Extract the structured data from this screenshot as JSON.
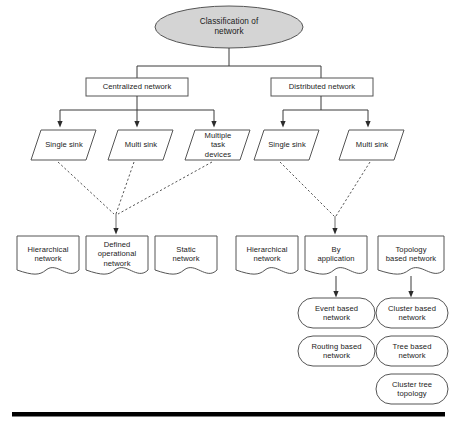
{
  "diagram": {
    "title_node": {
      "id": "root",
      "label": "Classification of\nnetwork",
      "shape": "ellipse",
      "fill": "#d4d4d4"
    },
    "level1": [
      {
        "id": "centralized",
        "label": "Centralized network",
        "shape": "rect"
      },
      {
        "id": "distributed",
        "label": "Distributed network",
        "shape": "rect"
      }
    ],
    "level2": [
      {
        "id": "c-single-sink",
        "label": "Single sink",
        "shape": "parallelogram",
        "parent": "centralized"
      },
      {
        "id": "c-multi-sink",
        "label": "Multi sink",
        "shape": "parallelogram",
        "parent": "centralized"
      },
      {
        "id": "c-multiple-task",
        "label": "Multiple\ntask\ndevices",
        "shape": "parallelogram",
        "parent": "centralized"
      },
      {
        "id": "d-single-sink",
        "label": "Single sink",
        "shape": "parallelogram",
        "parent": "distributed"
      },
      {
        "id": "d-multi-sink",
        "label": "Multi sink",
        "shape": "parallelogram",
        "parent": "distributed"
      }
    ],
    "level3": [
      {
        "id": "c-hierarchical",
        "label": "Hierarchical\nnetwork",
        "shape": "document"
      },
      {
        "id": "c-defined-operational",
        "label": "Defined\noperational\nnetwork",
        "shape": "document"
      },
      {
        "id": "c-static",
        "label": "Static\nnetwork",
        "shape": "document"
      },
      {
        "id": "d-hierarchical",
        "label": "Hierarchical\nnetwork",
        "shape": "document"
      },
      {
        "id": "d-by-application",
        "label": "By\napplication",
        "shape": "document"
      },
      {
        "id": "d-topology-based",
        "label": "Topology\nbased network",
        "shape": "document"
      }
    ],
    "level4": [
      {
        "id": "event-based",
        "label": "Event based\nnetwork",
        "shape": "rounded"
      },
      {
        "id": "cluster-based",
        "label": "Cluster based\nnetwork",
        "shape": "rounded"
      },
      {
        "id": "routing-based",
        "label": "Routing based\nnetwork",
        "shape": "rounded"
      },
      {
        "id": "tree-based",
        "label": "Tree based\nnetwork",
        "shape": "rounded"
      },
      {
        "id": "cluster-tree",
        "label": "Cluster tree\ntopology",
        "shape": "rounded"
      }
    ],
    "colors": {
      "stroke": "#4d4d4d",
      "ellipse_fill": "#d4d4d4",
      "node_fill": "#ffffff",
      "text": "#1a1a1a",
      "rule": "#000000"
    },
    "footer_rule": {
      "name": "horizontal-rule"
    }
  }
}
